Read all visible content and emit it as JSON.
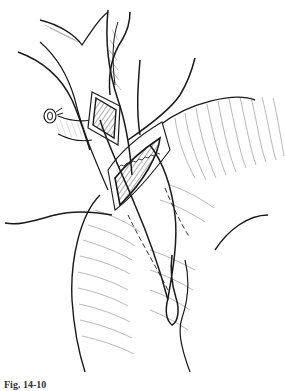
{
  "figure": {
    "ink_color": "#1a1a1a",
    "hatch_color": "#8a8a8a",
    "background": "#ffffff"
  },
  "caption": {
    "label": "Fig. 14-10",
    "text": "(caption text clipped at image edge)"
  }
}
